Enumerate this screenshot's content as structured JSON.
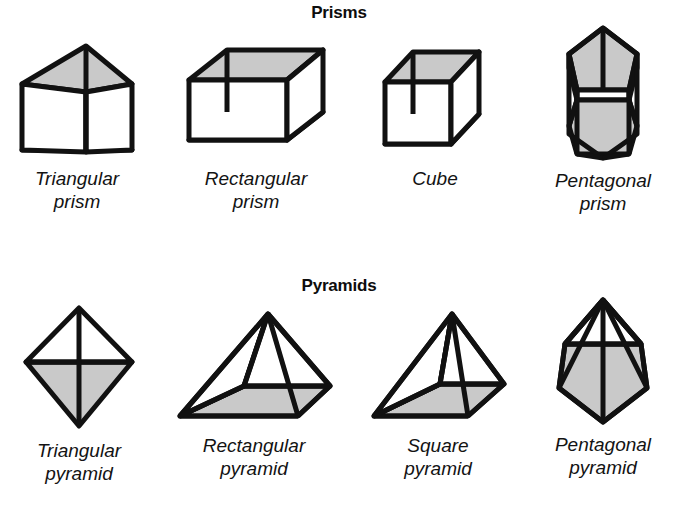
{
  "figure_title": "Prisms and Pyramids",
  "style": {
    "shade_color": "#c9c9c9",
    "stroke_color": "#111111",
    "background": "#ffffff"
  },
  "sections": [
    {
      "id": "prisms",
      "heading": "Prisms",
      "figures": [
        {
          "id": "triangular-prism",
          "icon": "triangular-prism-icon",
          "caption_line1": "Triangular",
          "caption_line2": "prism"
        },
        {
          "id": "rectangular-prism",
          "icon": "rectangular-prism-icon",
          "caption_line1": "Rectangular",
          "caption_line2": "prism"
        },
        {
          "id": "cube",
          "icon": "cube-icon",
          "caption_line1": "Cube",
          "caption_line2": ""
        },
        {
          "id": "pentagonal-prism",
          "icon": "pentagonal-prism-icon",
          "caption_line1": "Pentagonal",
          "caption_line2": "prism"
        }
      ]
    },
    {
      "id": "pyramids",
      "heading": "Pyramids",
      "figures": [
        {
          "id": "triangular-pyramid",
          "icon": "triangular-pyramid-icon",
          "caption_line1": "Triangular",
          "caption_line2": "pyramid"
        },
        {
          "id": "rectangular-pyramid",
          "icon": "rectangular-pyramid-icon",
          "caption_line1": "Rectangular",
          "caption_line2": "pyramid"
        },
        {
          "id": "square-pyramid",
          "icon": "square-pyramid-icon",
          "caption_line1": "Square",
          "caption_line2": "pyramid"
        },
        {
          "id": "pentagonal-pyramid",
          "icon": "pentagonal-pyramid-icon",
          "caption_line1": "Pentagonal",
          "caption_line2": "pyramid"
        }
      ]
    }
  ]
}
